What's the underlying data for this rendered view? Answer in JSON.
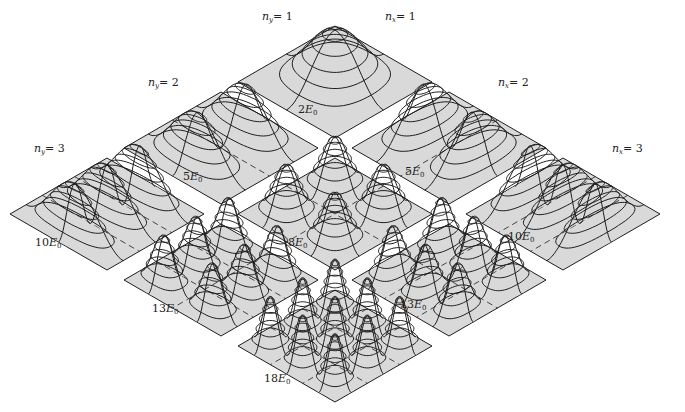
{
  "figure": {
    "colors": {
      "plate_fill": "#d9d9d9",
      "line": "#1e1e1e",
      "background": "#ffffff"
    },
    "geometry": {
      "origin_x": 335,
      "origin_y": 82,
      "step_x": 114,
      "step_y": 66,
      "half_w": 97,
      "half_h": 56,
      "peak_height": 52
    },
    "axis_labels": [
      {
        "id": "ny1",
        "var": "n",
        "sub": "y",
        "eq": "= 1",
        "x": 262,
        "y": 10
      },
      {
        "id": "nx1",
        "var": "n",
        "sub": "x",
        "eq": "= 1",
        "x": 385,
        "y": 10
      },
      {
        "id": "ny2",
        "var": "n",
        "sub": "y",
        "eq": "= 2",
        "x": 148,
        "y": 76
      },
      {
        "id": "nx2",
        "var": "n",
        "sub": "x",
        "eq": "= 2",
        "x": 498,
        "y": 76
      },
      {
        "id": "ny3",
        "var": "n",
        "sub": "y",
        "eq": "= 3",
        "x": 34,
        "y": 142
      },
      {
        "id": "nx3",
        "var": "n",
        "sub": "x",
        "eq": "= 3",
        "x": 612,
        "y": 142
      }
    ],
    "plates": [
      {
        "nx": 1,
        "ny": 1,
        "energy": "2E",
        "label_x": 298,
        "label_y": 103
      },
      {
        "nx": 1,
        "ny": 2,
        "energy": "5E",
        "label_x": 183,
        "label_y": 170
      },
      {
        "nx": 2,
        "ny": 1,
        "energy": "5E",
        "label_x": 405,
        "label_y": 165
      },
      {
        "nx": 1,
        "ny": 3,
        "energy": "10E",
        "label_x": 35,
        "label_y": 236
      },
      {
        "nx": 2,
        "ny": 2,
        "energy": "8E",
        "label_x": 288,
        "label_y": 236
      },
      {
        "nx": 3,
        "ny": 1,
        "energy": "10E",
        "label_x": 508,
        "label_y": 230
      },
      {
        "nx": 2,
        "ny": 3,
        "energy": "13E",
        "label_x": 152,
        "label_y": 302
      },
      {
        "nx": 3,
        "ny": 2,
        "energy": "13E",
        "label_x": 400,
        "label_y": 298
      },
      {
        "nx": 3,
        "ny": 3,
        "energy": "18E",
        "label_x": 264,
        "label_y": 372
      }
    ],
    "energy_subscript": "0"
  }
}
